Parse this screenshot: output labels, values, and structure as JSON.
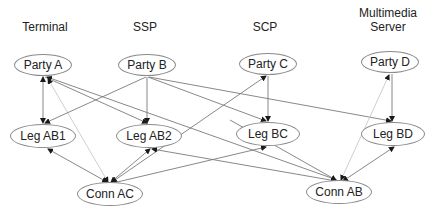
{
  "columns": [
    {
      "id": "terminal",
      "label": "Terminal",
      "x": 45,
      "y": 20
    },
    {
      "id": "ssp",
      "label": "SSP",
      "x": 145,
      "y": 20
    },
    {
      "id": "scp",
      "label": "SCP",
      "x": 265,
      "y": 20
    },
    {
      "id": "mms",
      "label": "Multimedia\nServer",
      "x": 388,
      "y": 6
    }
  ],
  "nodes": [
    {
      "id": "party_a",
      "label": "Party A",
      "cx": 43,
      "cy": 65,
      "w": 58,
      "h": 22
    },
    {
      "id": "party_b",
      "label": "Party B",
      "cx": 147,
      "cy": 65,
      "w": 58,
      "h": 22
    },
    {
      "id": "party_c",
      "label": "Party C",
      "cx": 268,
      "cy": 64,
      "w": 58,
      "h": 22
    },
    {
      "id": "party_d",
      "label": "Party D",
      "cx": 390,
      "cy": 62,
      "w": 58,
      "h": 22
    },
    {
      "id": "leg_ab1",
      "label": "Leg AB1",
      "cx": 43,
      "cy": 136,
      "w": 66,
      "h": 24
    },
    {
      "id": "leg_ab2",
      "label": "Leg AB2",
      "cx": 149,
      "cy": 136,
      "w": 66,
      "h": 24
    },
    {
      "id": "leg_bc",
      "label": "Leg BC",
      "cx": 268,
      "cy": 134,
      "w": 64,
      "h": 24
    },
    {
      "id": "leg_bd",
      "label": "Leg BD",
      "cx": 393,
      "cy": 134,
      "w": 64,
      "h": 24
    },
    {
      "id": "conn_ac",
      "label": "Conn AC",
      "cx": 110,
      "cy": 194,
      "w": 66,
      "h": 24
    },
    {
      "id": "conn_ab",
      "label": "Conn AB",
      "cx": 339,
      "cy": 192,
      "w": 66,
      "h": 24
    }
  ],
  "edges": [
    {
      "from": "party_a",
      "to": "leg_ab1",
      "x1": 43,
      "y1": 77,
      "x2": 43,
      "y2": 123,
      "arrow_start": true,
      "arrow_end": true,
      "style": "solid"
    },
    {
      "from": "party_a",
      "to": "leg_ab2",
      "x1": 45,
      "y1": 77,
      "x2": 147,
      "y2": 123,
      "arrow_start": false,
      "arrow_end": true,
      "style": "solid"
    },
    {
      "from": "party_a",
      "to": "conn_ab",
      "x1": 47,
      "y1": 77,
      "x2": 337,
      "y2": 180,
      "arrow_start": true,
      "arrow_end": false,
      "style": "solid"
    },
    {
      "from": "party_a",
      "to": "conn_ac",
      "x1": 48,
      "y1": 79,
      "x2": 108,
      "y2": 182,
      "arrow_start": true,
      "arrow_end": true,
      "style": "light"
    },
    {
      "from": "party_b",
      "to": "leg_ab1",
      "x1": 146,
      "y1": 77,
      "x2": 45,
      "y2": 123,
      "arrow_start": false,
      "arrow_end": true,
      "style": "solid"
    },
    {
      "from": "party_b",
      "to": "leg_ab2",
      "x1": 147,
      "y1": 77,
      "x2": 147,
      "y2": 123,
      "arrow_start": false,
      "arrow_end": true,
      "style": "solid"
    },
    {
      "from": "party_b",
      "to": "leg_bc",
      "x1": 148,
      "y1": 77,
      "x2": 266,
      "y2": 121,
      "arrow_start": false,
      "arrow_end": true,
      "style": "solid"
    },
    {
      "from": "party_b",
      "to": "leg_bd",
      "x1": 149,
      "y1": 77,
      "x2": 391,
      "y2": 121,
      "arrow_start": false,
      "arrow_end": true,
      "style": "solid"
    },
    {
      "from": "conn_ac",
      "to": "party_c",
      "x1": 112,
      "y1": 182,
      "x2": 266,
      "y2": 76,
      "arrow_start": true,
      "arrow_end": true,
      "style": "solid"
    },
    {
      "from": "party_c",
      "to": "leg_bc",
      "x1": 268,
      "y1": 76,
      "x2": 268,
      "y2": 121,
      "arrow_start": false,
      "arrow_end": true,
      "style": "solid"
    },
    {
      "from": "party_d",
      "to": "leg_bd",
      "x1": 392,
      "y1": 74,
      "x2": 392,
      "y2": 121,
      "arrow_start": false,
      "arrow_end": true,
      "style": "solid"
    },
    {
      "from": "conn_ab",
      "to": "party_d",
      "x1": 341,
      "y1": 180,
      "x2": 389,
      "y2": 75,
      "arrow_start": true,
      "arrow_end": true,
      "style": "light"
    },
    {
      "from": "leg_ab1",
      "to": "conn_ac",
      "x1": 48,
      "y1": 149,
      "x2": 107,
      "y2": 182,
      "arrow_start": true,
      "arrow_end": true,
      "style": "solid"
    },
    {
      "from": "leg_ab2",
      "to": "conn_ac",
      "x1": 150,
      "y1": 149,
      "x2": 111,
      "y2": 182,
      "arrow_start": true,
      "arrow_end": true,
      "style": "solid"
    },
    {
      "from": "conn_ac",
      "to": "leg_bc",
      "x1": 113,
      "y1": 183,
      "x2": 266,
      "y2": 147,
      "arrow_start": false,
      "arrow_end": true,
      "style": "solid"
    },
    {
      "from": "leg_ab2",
      "to": "conn_ab",
      "x1": 152,
      "y1": 149,
      "x2": 336,
      "y2": 181,
      "arrow_start": true,
      "arrow_end": true,
      "style": "solid"
    },
    {
      "from": "leg_bc",
      "to": "conn_ab",
      "x1": 230,
      "y1": 120,
      "x2": 336,
      "y2": 180,
      "arrow_start": false,
      "arrow_end": true,
      "style": "solid"
    },
    {
      "from": "leg_bd",
      "to": "conn_ab",
      "x1": 394,
      "y1": 147,
      "x2": 343,
      "y2": 181,
      "arrow_start": true,
      "arrow_end": true,
      "style": "solid"
    }
  ],
  "colors": {
    "edge": "#7a7a7a",
    "edge_light": "#c8c8c8",
    "node_border": "#8a8a8a",
    "arrow": "#1a1a1a",
    "text": "#222222"
  }
}
